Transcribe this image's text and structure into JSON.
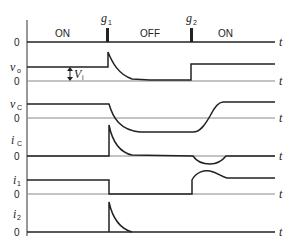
{
  "diagram": {
    "type": "timing-diagram",
    "time_axis_label": "t",
    "zero_label": "0",
    "gate_pulses": [
      {
        "label": "g",
        "sub": "1",
        "x": 108
      },
      {
        "label": "g",
        "sub": "2",
        "x": 191
      }
    ],
    "states": [
      {
        "label": "ON",
        "x": 63
      },
      {
        "label": "OFF",
        "x": 148
      },
      {
        "label": "ON",
        "x": 226
      }
    ],
    "traces": [
      {
        "name": "gate",
        "label": "",
        "sub": ""
      },
      {
        "name": "vo",
        "label": "v",
        "sub": "o"
      },
      {
        "name": "vc",
        "label": "v",
        "sub": "C"
      },
      {
        "name": "ic",
        "label": "i",
        "sub": "C"
      },
      {
        "name": "i1",
        "label": "i",
        "sub": "1"
      },
      {
        "name": "i2",
        "label": "i",
        "sub": "2"
      }
    ],
    "annotation": {
      "label": "V",
      "sub": "i"
    }
  }
}
